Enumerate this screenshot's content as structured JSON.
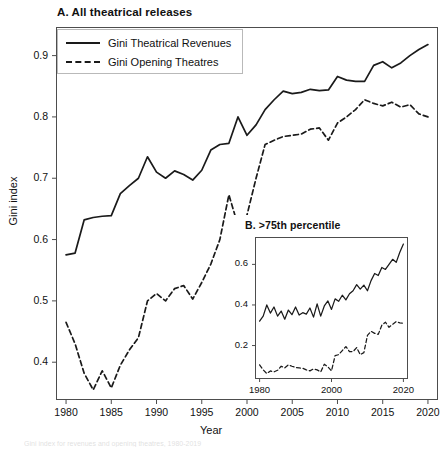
{
  "figure": {
    "panelA_title": "A. All theatrical releases",
    "panelB_title": "B. >75th percentile",
    "ylabel": "Gini index",
    "xlabel": "Year",
    "legend": [
      {
        "label": "Gini Theatrical Revenues",
        "style": "solid"
      },
      {
        "label": "Gini Opening Theatres",
        "style": "dashed"
      }
    ],
    "line_color": "#1a1a1a",
    "background": "#ffffff",
    "bottom_caption_fragment": "Gini index for revenues and opening theatres, 1980-2019"
  },
  "chart_data": [
    {
      "type": "line",
      "title": "A. All theatrical releases",
      "xlabel": "Year",
      "ylabel": "Gini index",
      "xlim": [
        1979,
        2021
      ],
      "ylim": [
        0.34,
        0.945
      ],
      "xticks": [
        1980,
        1985,
        1990,
        1995,
        2000,
        2005,
        2010,
        2015,
        2020
      ],
      "yticks": [
        0.4,
        0.5,
        0.6,
        0.7,
        0.8,
        0.9
      ],
      "grid": false,
      "legend_position": "upper left",
      "x": [
        1980,
        1981,
        1982,
        1983,
        1984,
        1985,
        1986,
        1987,
        1988,
        1989,
        1990,
        1991,
        1992,
        1993,
        1994,
        1995,
        1996,
        1997,
        1998,
        1999,
        2000,
        2001,
        2002,
        2003,
        2004,
        2005,
        2006,
        2007,
        2008,
        2009,
        2010,
        2011,
        2012,
        2013,
        2014,
        2015,
        2016,
        2017,
        2018,
        2019,
        2020
      ],
      "series": [
        {
          "name": "Gini Theatrical Revenues",
          "style": "solid",
          "values": [
            0.575,
            0.578,
            0.632,
            0.636,
            0.638,
            0.639,
            0.675,
            0.688,
            0.7,
            0.735,
            0.71,
            0.7,
            0.712,
            0.706,
            0.697,
            0.713,
            0.746,
            0.755,
            0.757,
            0.8,
            0.77,
            0.787,
            0.812,
            0.828,
            0.842,
            0.838,
            0.84,
            0.845,
            0.843,
            0.844,
            0.866,
            0.86,
            0.858,
            0.858,
            0.884,
            0.89,
            0.88,
            0.888,
            0.9,
            0.91,
            0.918
          ]
        },
        {
          "name": "Gini Opening Theatres",
          "style": "dashed",
          "values": [
            0.465,
            0.43,
            0.382,
            0.355,
            0.386,
            0.358,
            0.395,
            0.42,
            0.44,
            0.5,
            0.512,
            0.5,
            0.52,
            0.525,
            0.503,
            0.53,
            0.56,
            0.6,
            0.673,
            0.623,
            0.64,
            0.7,
            0.755,
            0.762,
            0.768,
            0.77,
            0.772,
            0.78,
            0.782,
            0.762,
            0.79,
            0.8,
            0.812,
            0.828,
            0.822,
            0.818,
            0.824,
            0.816,
            0.82,
            0.805,
            0.8
          ]
        }
      ]
    },
    {
      "type": "line",
      "title": "B. >75th percentile",
      "xlabel": "",
      "ylabel": "",
      "xlim": [
        1979,
        2021
      ],
      "ylim": [
        0.04,
        0.73
      ],
      "xticks": [
        1980,
        2000,
        2020
      ],
      "yticks": [
        0.2,
        0.4,
        0.6
      ],
      "grid": false,
      "x": [
        1980,
        1981,
        1982,
        1983,
        1984,
        1985,
        1986,
        1987,
        1988,
        1989,
        1990,
        1991,
        1992,
        1993,
        1994,
        1995,
        1996,
        1997,
        1998,
        1999,
        2000,
        2001,
        2002,
        2003,
        2004,
        2005,
        2006,
        2007,
        2008,
        2009,
        2010,
        2011,
        2012,
        2013,
        2014,
        2015,
        2016,
        2017,
        2018,
        2019,
        2020
      ],
      "series": [
        {
          "name": "Gini Theatrical Revenues",
          "style": "solid",
          "values": [
            0.32,
            0.345,
            0.4,
            0.36,
            0.39,
            0.345,
            0.37,
            0.33,
            0.375,
            0.352,
            0.39,
            0.35,
            0.362,
            0.355,
            0.385,
            0.34,
            0.405,
            0.345,
            0.395,
            0.42,
            0.378,
            0.43,
            0.418,
            0.448,
            0.425,
            0.455,
            0.47,
            0.5,
            0.478,
            0.498,
            0.47,
            0.52,
            0.555,
            0.545,
            0.585,
            0.575,
            0.6,
            0.625,
            0.61,
            0.66,
            0.7
          ]
        },
        {
          "name": "Gini Opening Theatres",
          "style": "dashed",
          "values": [
            0.105,
            0.08,
            0.062,
            0.075,
            0.07,
            0.078,
            0.098,
            0.09,
            0.105,
            0.098,
            0.092,
            0.09,
            0.088,
            0.08,
            0.075,
            0.085,
            0.08,
            0.07,
            0.108,
            0.095,
            0.075,
            0.15,
            0.155,
            0.175,
            0.195,
            0.17,
            0.17,
            0.19,
            0.155,
            0.165,
            0.25,
            0.27,
            0.26,
            0.255,
            0.3,
            0.315,
            0.29,
            0.305,
            0.318,
            0.312,
            0.31
          ]
        }
      ]
    }
  ],
  "axes_main": {
    "xtick_labels": [
      "1980",
      "1985",
      "1990",
      "1995",
      "2000",
      "2005",
      "2010",
      "2015",
      "2020"
    ],
    "ytick_labels": [
      "0.4",
      "0.5",
      "0.6",
      "0.7",
      "0.8",
      "0.9"
    ]
  },
  "axes_inset": {
    "xtick_labels": [
      "1980",
      "2000",
      "2020"
    ],
    "ytick_labels": [
      "0.2",
      "0.4",
      "0.6"
    ]
  }
}
